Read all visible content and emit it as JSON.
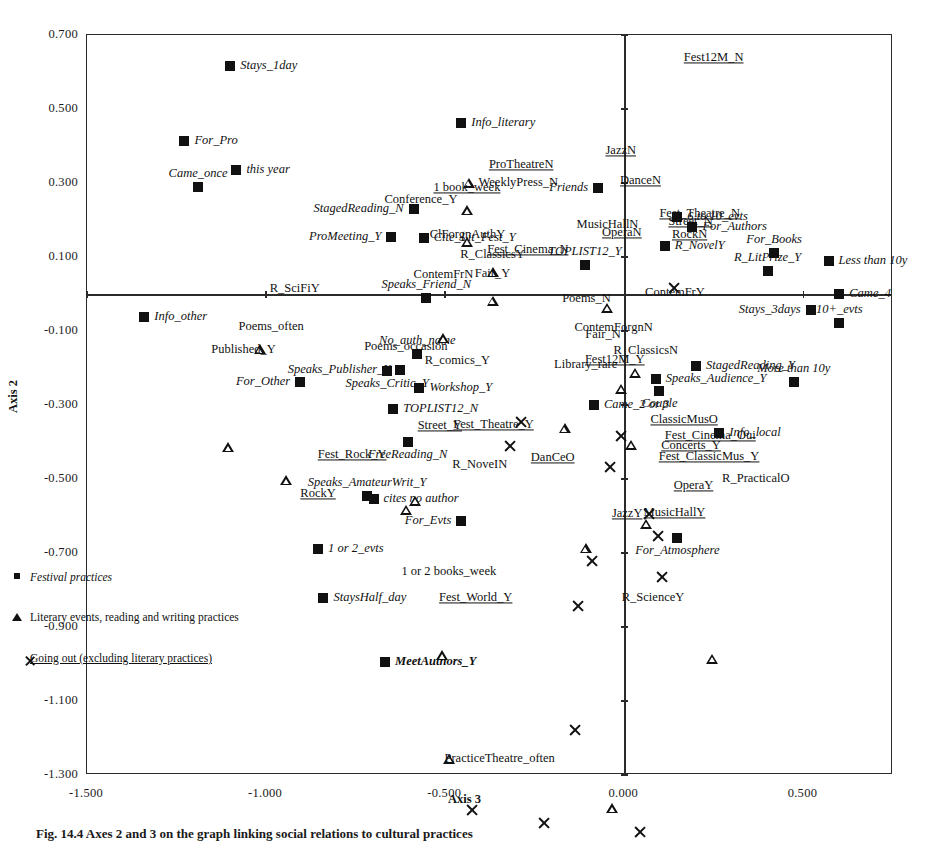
{
  "figure": {
    "caption": "Fig. 14.4 Axes 2 and 3 on the graph linking social relations to cultural practices"
  },
  "legend": {
    "items": [
      {
        "marker": "square-marker",
        "label": "Festival practices"
      },
      {
        "marker": "triangle-marker",
        "label": "Literary events, reading and writing practices"
      },
      {
        "marker": "cross-marker",
        "label": "Going out (excluding literary practices)"
      }
    ]
  },
  "chart_data": {
    "type": "scatter",
    "title": "",
    "xlabel": "Axis 3",
    "ylabel": "Axis 2",
    "xlim": [
      -1.5,
      0.75
    ],
    "ylim": [
      -1.3,
      0.7
    ],
    "xticks": [
      "-1.500",
      "-1.000",
      "-0.500",
      "0.000",
      "0.500"
    ],
    "xtick_values": [
      -1.5,
      -1.0,
      -0.5,
      0.0,
      0.5
    ],
    "yticks": [
      "0.700",
      "0.500",
      "0.300",
      "0.100",
      "-0.100",
      "-0.300",
      "-0.500",
      "-0.700",
      "-0.900",
      "-1.100",
      "-1.300"
    ],
    "ytick_values": [
      0.7,
      0.5,
      0.3,
      0.1,
      -0.1,
      -0.3,
      -0.5,
      -0.7,
      -0.9,
      -1.1,
      -1.3
    ],
    "grid": false,
    "legend_position": "lower-left-inside",
    "series": [
      {
        "name": "Festival practices",
        "marker": "square",
        "label_style": "italic",
        "points": [
          {
            "label": "Stays_1day",
            "x": -1.1,
            "y": 0.617,
            "lp": "left"
          },
          {
            "label": "For_Pro",
            "x": -1.228,
            "y": 0.414,
            "lp": "left"
          },
          {
            "label": "this year",
            "x": -1.083,
            "y": 0.336,
            "lp": "left"
          },
          {
            "label": "Came_once",
            "x": -1.19,
            "y": 0.288,
            "lp": "center"
          },
          {
            "label": "Info_literary",
            "x": -0.455,
            "y": 0.463,
            "lp": "left"
          },
          {
            "label": "StagedReading_N",
            "x": -0.588,
            "y": 0.23,
            "lp": "right"
          },
          {
            "label": "ProMeeting_Y",
            "x": -0.65,
            "y": 0.153,
            "lp": "right"
          },
          {
            "label": "Cite_Lit_Fest_Y",
            "x": -0.56,
            "y": 0.152,
            "lp": "left"
          },
          {
            "label": "Friends",
            "x": -0.073,
            "y": 0.286,
            "lp": "right"
          },
          {
            "label": "6 to 10_evts",
            "x": 0.148,
            "y": 0.207,
            "lp": "left"
          },
          {
            "label": "For_Authors",
            "x": 0.19,
            "y": 0.182,
            "lp": "left"
          },
          {
            "label": "R_NovelY",
            "x": 0.113,
            "y": 0.13,
            "lp": "left"
          },
          {
            "label": "For_Books",
            "x": 0.418,
            "y": 0.11,
            "lp": "center"
          },
          {
            "label": "Less than 10y",
            "x": 0.57,
            "y": 0.09,
            "lp": "left"
          },
          {
            "label": "R_LitPrize_Y",
            "x": 0.4,
            "y": 0.062,
            "lp": "center"
          },
          {
            "label": "TOPLIST12_Y",
            "x": -0.11,
            "y": 0.078,
            "lp": "center"
          },
          {
            "label": "Speaks_Friend_N",
            "x": -0.553,
            "y": -0.012,
            "lp": "center"
          },
          {
            "label": "Came_4",
            "x": 0.6,
            "y": 0.0,
            "lp": "left"
          },
          {
            "label": "Stays_3days",
            "x": 0.52,
            "y": -0.043,
            "lp": "right"
          },
          {
            "label": "10+_evts",
            "x": 0.6,
            "y": -0.078,
            "lp": "center"
          },
          {
            "label": "Info_other",
            "x": -1.34,
            "y": -0.063,
            "lp": "left"
          },
          {
            "label": "No_auth_name",
            "x": -0.578,
            "y": -0.163,
            "lp": "leader-up"
          },
          {
            "label": "Speaks_Publisher_Y",
            "x": -0.625,
            "y": -0.205,
            "lp": "right"
          },
          {
            "label": "Speaks_Critic_Y",
            "x": -0.662,
            "y": -0.208,
            "lp": "below"
          },
          {
            "label": "For_Other",
            "x": -0.905,
            "y": -0.237,
            "lp": "right"
          },
          {
            "label": "Workshop_Y",
            "x": -0.572,
            "y": -0.253,
            "lp": "left"
          },
          {
            "label": "StagedReading_Y",
            "x": 0.2,
            "y": -0.195,
            "lp": "left"
          },
          {
            "label": "Speaks_Audience_Y",
            "x": 0.088,
            "y": -0.23,
            "lp": "left"
          },
          {
            "label": "More than 10y",
            "x": 0.473,
            "y": -0.237,
            "lp": "center"
          },
          {
            "label": "Couple",
            "x": 0.098,
            "y": -0.263,
            "lp": "below"
          },
          {
            "label": "TOPLIST12_N",
            "x": -0.645,
            "y": -0.312,
            "lp": "left"
          },
          {
            "label": "Came_2 or 3",
            "x": -0.085,
            "y": -0.3,
            "lp": "left"
          },
          {
            "label": "Info_local",
            "x": 0.265,
            "y": -0.375,
            "lp": "left"
          },
          {
            "label": "FreeReading_N",
            "x": -0.605,
            "y": -0.4,
            "lp": "below"
          },
          {
            "label": "cites no author",
            "x": -0.7,
            "y": -0.555,
            "lp": "left"
          },
          {
            "label": "Speaks_AmateurWrit_Y",
            "x": -0.718,
            "y": -0.545,
            "lp": "above"
          },
          {
            "label": "For_Evts",
            "x": -0.455,
            "y": -0.613,
            "lp": "right"
          },
          {
            "label": "For_Atmosphere",
            "x": 0.148,
            "y": -0.66,
            "lp": "below"
          },
          {
            "label": "1 or 2_evts",
            "x": -0.855,
            "y": -0.69,
            "lp": "left"
          },
          {
            "label": "StaysHalf_day",
            "x": -0.84,
            "y": -0.822,
            "lp": "left"
          },
          {
            "label": "MeetAuthors_Y",
            "x": -0.668,
            "y": -0.995,
            "lp": "left"
          }
        ]
      },
      {
        "name": "Literary events, reading and writing practices",
        "marker": "triangle",
        "label_style": "plain",
        "points": [
          {
            "label": "WeeklyPress_N",
            "x": -0.435,
            "y": 0.3,
            "lp": "leader-right"
          },
          {
            "label": "Conference_Y",
            "x": -0.438,
            "y": 0.253,
            "lp": "right"
          },
          {
            "label": "ClForgnAuthY",
            "x": -0.438,
            "y": 0.195,
            "lp": "below"
          },
          {
            "label": "R_ClassicsY",
            "x": -0.368,
            "y": 0.14,
            "lp": "below"
          },
          {
            "label": "Fair_Y",
            "x": -0.368,
            "y": 0.09,
            "lp": "below"
          },
          {
            "label": "ContemFrN",
            "x": -0.505,
            "y": 0.015,
            "lp": "above"
          },
          {
            "label": "R_SciFiY",
            "x": -1.018,
            "y": 0.013,
            "lp": "left"
          },
          {
            "label": "MusicHallN",
            "x": -0.047,
            "y": 0.152,
            "lp": "above"
          },
          {
            "label": "ContemFrY",
            "x": 0.03,
            "y": 0.003,
            "lp": "left"
          },
          {
            "label": "Poems_N",
            "x": -0.01,
            "y": -0.013,
            "lp": "leader-left"
          },
          {
            "label": "ContemForgnN",
            "x": -0.167,
            "y": -0.093,
            "lp": "left"
          },
          {
            "label": "Fair_N",
            "x": 0.018,
            "y": -0.11,
            "lp": "right"
          },
          {
            "label": "Poems_often",
            "x": -1.105,
            "y": -0.09,
            "lp": "left"
          },
          {
            "label": "Published_Y",
            "x": -0.945,
            "y": -0.152,
            "lp": "right"
          },
          {
            "label": "R_comics_Y",
            "x": -0.585,
            "y": -0.18,
            "lp": "left"
          },
          {
            "label": "Poems_occasion",
            "x": -0.61,
            "y": -0.178,
            "lp": "above"
          },
          {
            "label": "R_ClassicsN",
            "x": 0.06,
            "y": -0.188,
            "lp": "above"
          },
          {
            "label": "Library_rare",
            "x": -0.108,
            "y": -0.228,
            "lp": "above"
          },
          {
            "label": "R_PracticalO",
            "x": 0.245,
            "y": -0.5,
            "lp": "left"
          },
          {
            "label": "R_NoveIN",
            "x": -0.508,
            "y": -0.463,
            "lp": "left"
          },
          {
            "label": "1 or 2 books_week",
            "x": -0.49,
            "y": -0.715,
            "lp": "below"
          },
          {
            "label": "R_ScienceY",
            "x": -0.035,
            "y": -0.822,
            "lp": "left"
          },
          {
            "label": "PracticeTheatre_often",
            "x": -0.53,
            "y": -1.258,
            "lp": "left"
          }
        ]
      },
      {
        "name": "Going out (excluding literary practices)",
        "marker": "cross",
        "label_style": "underline",
        "points": [
          {
            "label": "Fest12M_N",
            "x": 0.138,
            "y": 0.638,
            "lp": "left"
          },
          {
            "label": "ProTheatreN",
            "x": -0.288,
            "y": 0.313,
            "lp": "above"
          },
          {
            "label": "1 book_week",
            "x": -0.318,
            "y": 0.287,
            "lp": "leader"
          },
          {
            "label": "JazzN",
            "x": -0.01,
            "y": 0.352,
            "lp": "above"
          },
          {
            "label": "DanceN",
            "x": -0.04,
            "y": 0.305,
            "lp": "leader-right"
          },
          {
            "label": "Fest_Theatre_N",
            "x": 0.07,
            "y": 0.215,
            "lp": "leader-right"
          },
          {
            "label": "Street_N",
            "x": 0.095,
            "y": 0.195,
            "lp": "leader-right"
          },
          {
            "label": "OperaN",
            "x": -0.09,
            "y": 0.165,
            "lp": "left"
          },
          {
            "label": "RockN",
            "x": 0.105,
            "y": 0.16,
            "lp": "leader-right"
          },
          {
            "label": "Fest_Cinema_N",
            "x": -0.128,
            "y": 0.118,
            "lp": "leader"
          },
          {
            "label": "Fest12M_Y",
            "x": -0.138,
            "y": -0.178,
            "lp": "left"
          },
          {
            "label": "Street_Y",
            "x": -0.425,
            "y": -0.357,
            "lp": "leader-left"
          },
          {
            "label": "Fest_Theatre_Y",
            "x": -0.225,
            "y": -0.355,
            "lp": "leader-left"
          },
          {
            "label": "ClassicMusO",
            "x": 0.045,
            "y": -0.34,
            "lp": "left"
          },
          {
            "label": "Fest_Cinema_Oui",
            "x": 0.085,
            "y": -0.383,
            "lp": "left"
          },
          {
            "label": "Concerts_Y",
            "x": 0.075,
            "y": -0.41,
            "lp": "left"
          },
          {
            "label": "Fest_ClassicMus_Y",
            "x": 0.068,
            "y": -0.44,
            "lp": "left"
          },
          {
            "label": "DanCeO",
            "x": -0.2,
            "y": -0.408,
            "lp": "below"
          },
          {
            "label": "Fest_Rock_Y",
            "x": -0.76,
            "y": -0.47,
            "lp": "above"
          },
          {
            "label": "RockY",
            "x": -0.855,
            "y": -0.505,
            "lp": "below"
          },
          {
            "label": "OperaY",
            "x": 0.11,
            "y": -0.52,
            "lp": "left"
          },
          {
            "label": "MusicHallY",
            "x": 0.14,
            "y": -0.628,
            "lp": "above"
          },
          {
            "label": "JazzY",
            "x": 0.008,
            "y": -0.63,
            "lp": "above"
          },
          {
            "label": "Fest_World_Y",
            "x": -0.545,
            "y": -0.822,
            "lp": "left"
          }
        ]
      }
    ]
  }
}
